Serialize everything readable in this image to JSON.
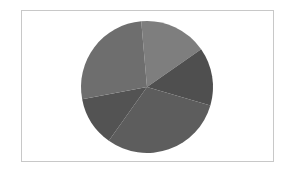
{
  "chart_data": {
    "type": "pie",
    "title": "",
    "legend": [],
    "start_angle_deg": -5,
    "direction": "clockwise",
    "center": [
      147,
      87
    ],
    "radius": 66,
    "slices": [
      {
        "label": "",
        "value": 16.7,
        "color": "#7e7e7e"
      },
      {
        "label": "",
        "value": 14.2,
        "color": "#4f4f4f"
      },
      {
        "label": "",
        "value": 30.3,
        "color": "#5d5d5d"
      },
      {
        "label": "",
        "value": 12.2,
        "color": "#535353"
      },
      {
        "label": "",
        "value": 26.6,
        "color": "#6e6e6e"
      }
    ],
    "values": [
      16.7,
      14.2,
      30.3,
      12.2,
      26.6
    ],
    "categories": [
      "",
      "",
      "",
      "",
      ""
    ]
  },
  "colors": {
    "frame_border": "#c8c8c8",
    "background": "#ffffff"
  }
}
